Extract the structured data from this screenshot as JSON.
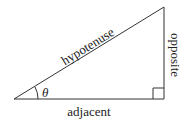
{
  "diagram": {
    "type": "right-triangle",
    "labels": {
      "hypotenuse": "hypotenuse",
      "opposite": "opposite",
      "adjacent": "adjacent",
      "angle": "θ"
    },
    "colors": {
      "stroke": "#333333",
      "text": "#222222",
      "background": "#ffffff"
    }
  }
}
